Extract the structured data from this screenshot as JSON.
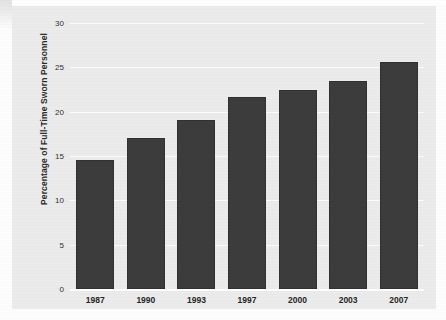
{
  "chart_data": {
    "type": "bar",
    "title": "",
    "subtitle": "",
    "xlabel": "",
    "ylabel": "Percentage of Full-Time Sworn Personnel",
    "categories": [
      "1987",
      "1990",
      "1993",
      "1997",
      "2000",
      "2003",
      "2007"
    ],
    "values": [
      14.6,
      17.0,
      19.1,
      21.6,
      22.5,
      23.5,
      25.6
    ],
    "ylim": [
      0,
      30
    ],
    "ytick_values": [
      0,
      5,
      10,
      15,
      20,
      25,
      30
    ],
    "ytick_labels": [
      "0",
      "5",
      "10",
      "15",
      "20",
      "25",
      "30"
    ],
    "grid": "horizontal",
    "legend": "none",
    "bar_color": "#3c3c3c",
    "plot_background": "#ebebeb",
    "gridline_color": "#fbfbfb",
    "annotations": []
  },
  "figure": {
    "y_axis_title": "Percentage of Full-Time Sworn Personnel"
  }
}
